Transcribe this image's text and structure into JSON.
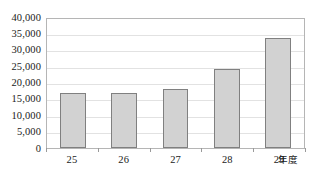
{
  "chart_data": {
    "type": "bar",
    "title": "",
    "subtitle": "",
    "xlabel": "年度",
    "ylabel": "",
    "categories": [
      "25",
      "26",
      "27",
      "28",
      "29"
    ],
    "values": [
      16600,
      16600,
      17800,
      23900,
      33500
    ],
    "ylim": [
      0,
      40000
    ],
    "ytick_values": [
      0,
      5000,
      10000,
      15000,
      20000,
      25000,
      30000,
      35000,
      40000
    ],
    "ytick_labels": [
      "0",
      "5,000",
      "10,000",
      "15,000",
      "20,000",
      "25,000",
      "30,000",
      "35,000",
      "40,000"
    ],
    "grid": true,
    "grid_axis": "y",
    "legend": false,
    "legend_position": "none",
    "series": [
      {
        "name": "",
        "values": [
          16600,
          16600,
          17800,
          23900,
          33500
        ]
      }
    ],
    "colors": {
      "bar_fill": "#d2d2d2",
      "bar_border": "#808080",
      "gridline": "#e2e2e2",
      "plot_border": "#b5b5b5",
      "text": "#1a1a1a"
    }
  }
}
